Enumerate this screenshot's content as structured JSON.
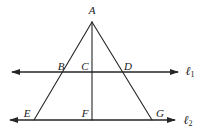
{
  "figure": {
    "type": "geometry-diagram",
    "stroke_color": "#262626",
    "background_color": "#ffffff",
    "width": 208,
    "height": 138
  },
  "points": [
    {
      "id": "A",
      "label": "A",
      "x": 92,
      "y": 22,
      "label_x": 92,
      "label_y": 10
    },
    {
      "id": "B",
      "label": "B",
      "x": 68,
      "y": 72,
      "label_x": 61,
      "label_y": 66
    },
    {
      "id": "C",
      "label": "C",
      "x": 92,
      "y": 72,
      "label_x": 85,
      "label_y": 66
    },
    {
      "id": "D",
      "label": "D",
      "x": 120,
      "y": 72,
      "label_x": 128,
      "label_y": 66
    },
    {
      "id": "E",
      "label": "E",
      "x": 34,
      "y": 120,
      "label_x": 27,
      "label_y": 113
    },
    {
      "id": "F",
      "label": "F",
      "x": 92,
      "y": 120,
      "label_x": 85,
      "label_y": 113
    },
    {
      "id": "G",
      "label": "G",
      "x": 152,
      "y": 120,
      "label_x": 160,
      "label_y": 113
    }
  ],
  "segments": [
    {
      "id": "left-leg",
      "from": "A",
      "to": "E"
    },
    {
      "id": "right-leg",
      "from": "A",
      "to": "G"
    },
    {
      "id": "median",
      "from": "A",
      "to": "F"
    }
  ],
  "lines": [
    {
      "id": "l1",
      "label": "ℓ",
      "subscript": "1",
      "y": 72,
      "x_start": 12,
      "x_end": 178,
      "label_x": 190,
      "label_y": 71,
      "arrow_left": true,
      "arrow_right": true
    },
    {
      "id": "l2",
      "label": "ℓ",
      "subscript": "2",
      "y": 120,
      "x_start": 10,
      "x_end": 175,
      "label_x": 188,
      "label_y": 120,
      "arrow_left": true,
      "arrow_right": true
    }
  ]
}
